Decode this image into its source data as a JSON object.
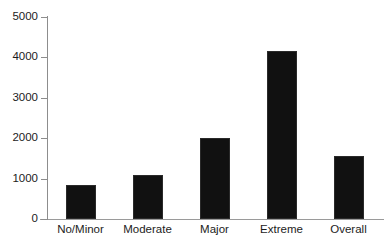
{
  "chart_data": {
    "type": "bar",
    "title": "",
    "xlabel": "",
    "ylabel": "",
    "categories": [
      "No/Minor",
      "Moderate",
      "Major",
      "Extreme",
      "Overall"
    ],
    "values": [
      850,
      1100,
      2000,
      4150,
      1570
    ],
    "ylim": [
      0,
      5000
    ],
    "yticks": [
      0,
      1000,
      2000,
      3000,
      4000,
      5000
    ],
    "ytick_labels": [
      "0",
      "1000",
      "2000",
      "3000",
      "4000",
      "5000"
    ],
    "grid": false,
    "legend": null,
    "bar_color": "#111111",
    "axis_color": "#8d8d8d",
    "background_color": "#ffffff"
  },
  "axes": {
    "y_tick_labels": [
      "5000",
      "4000",
      "3000",
      "2000",
      "1000",
      "0"
    ],
    "x_tick_labels": [
      "No/Minor",
      "Moderate",
      "Major",
      "Extreme",
      "Overall"
    ]
  }
}
